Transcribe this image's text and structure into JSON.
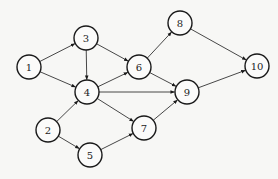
{
  "diagram": {
    "type": "directed-graph",
    "colors": {
      "background": "#f7f7f5",
      "stroke": "#1a1a1a",
      "edge": "#333333",
      "text": "#222222"
    },
    "node_radius": 12,
    "nodes": [
      {
        "id": "1",
        "label": "1",
        "x": 29,
        "y": 67
      },
      {
        "id": "2",
        "label": "2",
        "x": 48,
        "y": 130
      },
      {
        "id": "3",
        "label": "3",
        "x": 86,
        "y": 38
      },
      {
        "id": "4",
        "label": "4",
        "x": 87,
        "y": 92
      },
      {
        "id": "5",
        "label": "5",
        "x": 90,
        "y": 155
      },
      {
        "id": "6",
        "label": "6",
        "x": 139,
        "y": 67
      },
      {
        "id": "7",
        "label": "7",
        "x": 144,
        "y": 128
      },
      {
        "id": "8",
        "label": "8",
        "x": 180,
        "y": 23
      },
      {
        "id": "9",
        "label": "9",
        "x": 187,
        "y": 92
      },
      {
        "id": "10",
        "label": "10",
        "x": 257,
        "y": 66
      }
    ],
    "edges": [
      {
        "from": "1",
        "to": "3"
      },
      {
        "from": "1",
        "to": "4"
      },
      {
        "from": "3",
        "to": "4"
      },
      {
        "from": "3",
        "to": "6"
      },
      {
        "from": "4",
        "to": "6"
      },
      {
        "from": "4",
        "to": "9"
      },
      {
        "from": "4",
        "to": "7"
      },
      {
        "from": "6",
        "to": "8"
      },
      {
        "from": "6",
        "to": "9"
      },
      {
        "from": "8",
        "to": "10"
      },
      {
        "from": "9",
        "to": "10"
      },
      {
        "from": "2",
        "to": "4"
      },
      {
        "from": "2",
        "to": "5"
      },
      {
        "from": "5",
        "to": "7"
      },
      {
        "from": "7",
        "to": "9"
      }
    ]
  }
}
